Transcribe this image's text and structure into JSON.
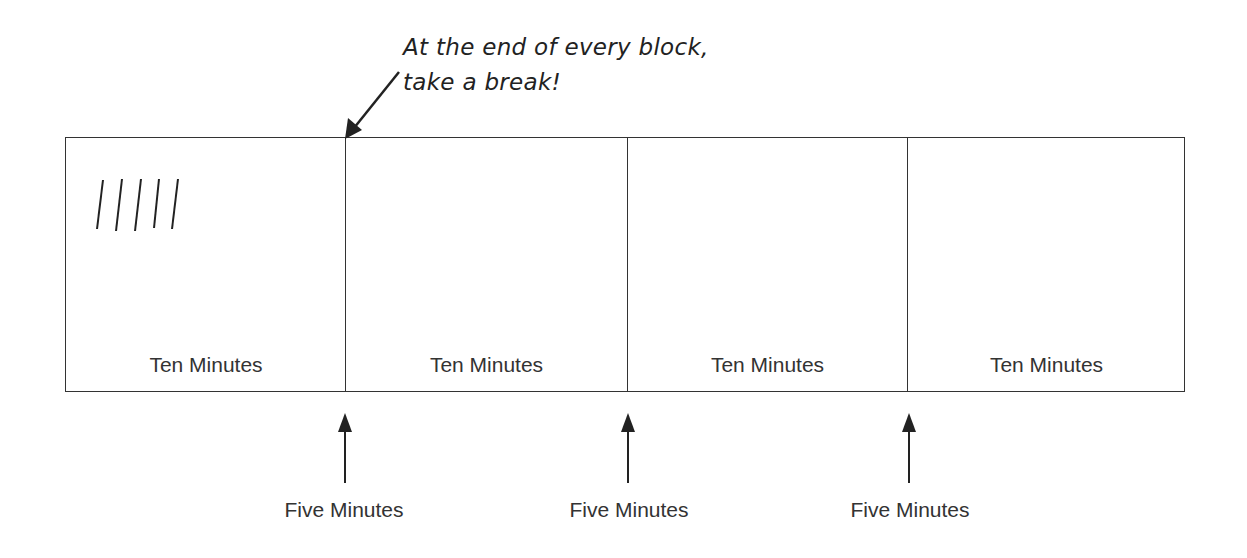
{
  "caption": {
    "line1": "At the end of every block,",
    "line2": "take a break!"
  },
  "blocks": [
    {
      "label": "Ten Minutes"
    },
    {
      "label": "Ten Minutes"
    },
    {
      "label": "Ten Minutes"
    },
    {
      "label": "Ten Minutes"
    }
  ],
  "breaks": [
    {
      "label": "Five Minutes"
    },
    {
      "label": "Five Minutes"
    },
    {
      "label": "Five Minutes"
    }
  ],
  "tally_marks": 5,
  "colors": {
    "line": "#333333",
    "text": "#2a2a2a",
    "background": "#ffffff"
  }
}
